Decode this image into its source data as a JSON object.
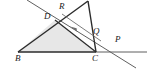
{
  "figure": {
    "type": "geometry-diagram",
    "width": 152,
    "height": 74,
    "background_color": "#ffffff",
    "stroke_color": "#2b2b2b",
    "thin_stroke_color": "#6d6d6d",
    "shade_fill": "#e6e6e6",
    "labels": [
      {
        "text": "R",
        "x": 59,
        "y": 3
      },
      {
        "text": "D",
        "x": 45,
        "y": 13
      },
      {
        "text": "Q",
        "x": 94,
        "y": 28
      },
      {
        "text": "P",
        "x": 115,
        "y": 36
      },
      {
        "text": "B",
        "x": 16,
        "y": 54
      },
      {
        "text": "C",
        "x": 93,
        "y": 54
      }
    ],
    "points": {
      "A": {
        "x": 88,
        "y": 1
      },
      "R": {
        "x": 63,
        "y": 14
      },
      "D": {
        "x": 55,
        "y": 20
      },
      "Q": {
        "x": 99,
        "y": 39
      },
      "P": {
        "x": 113,
        "y": 48
      },
      "B": {
        "x": 18,
        "y": 52
      },
      "C": {
        "x": 96,
        "y": 52
      }
    },
    "shaded_polygon": "B,D,C",
    "segments": [
      {
        "name": "side-AB",
        "from": "A",
        "to": "B",
        "style": "thick"
      },
      {
        "name": "side-AC",
        "from": "A",
        "to": "C",
        "style": "thick"
      },
      {
        "name": "side-BC",
        "from": "B",
        "to": "C",
        "style": "thick"
      },
      {
        "name": "segment-DC",
        "from": "D",
        "to": "C",
        "style": "thick"
      },
      {
        "name": "line-through-D-P",
        "from": "(27,0)",
        "to": "(135,67)",
        "style": "thin-extended"
      },
      {
        "name": "line-BC-extended-to-P",
        "from": "C",
        "to": "(146,52)",
        "style": "thin"
      },
      {
        "name": "segment-R-Q",
        "from": "R",
        "to": "Q",
        "style": "thin-arrow"
      }
    ],
    "arrow_marker": {
      "on": "segment-R-Q",
      "direction": "toward-R",
      "x": 73,
      "y": 31
    }
  }
}
